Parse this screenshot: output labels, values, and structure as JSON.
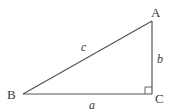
{
  "diagram": {
    "type": "right-triangle",
    "vertices": [
      {
        "id": "A",
        "label": "A",
        "x": 152,
        "y": 21
      },
      {
        "id": "B",
        "label": "B",
        "x": 23,
        "y": 94
      },
      {
        "id": "C",
        "label": "C",
        "x": 152,
        "y": 94
      }
    ],
    "sides": [
      {
        "id": "a",
        "label": "a",
        "from": "B",
        "to": "C"
      },
      {
        "id": "b",
        "label": "b",
        "from": "C",
        "to": "A"
      },
      {
        "id": "c",
        "label": "c",
        "from": "B",
        "to": "A"
      }
    ],
    "right_angle_at": "C",
    "colors": {
      "line": "#555555",
      "text": "#3a3a3a",
      "background": "#ffffff"
    }
  }
}
